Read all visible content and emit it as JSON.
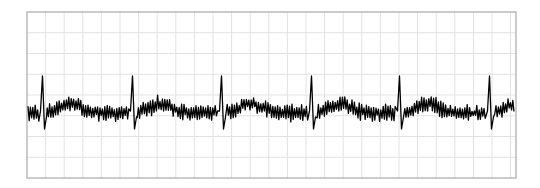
{
  "chart_data": {
    "type": "line",
    "title": "",
    "xlabel": "",
    "ylabel": "",
    "grid": true,
    "legend": null,
    "plot_area": {
      "left": 27,
      "top": 12,
      "right": 516,
      "bottom": 178
    },
    "grid_spacing": {
      "x": 18.6,
      "y": 20.75
    },
    "colors": {
      "frame": "#a8a8a8",
      "grid": "#e2e2e2",
      "trace": "#000000",
      "background": "#ffffff"
    },
    "beats": {
      "count": 6,
      "spike_x": [
        43,
        133,
        222,
        312,
        400,
        490
      ],
      "spike_peak_y": 76,
      "post_spike_dip_y": 129
    },
    "baseline": {
      "center_y": 113,
      "noise_amplitude": 10,
      "t_wave_offset_px": 28,
      "t_wave_width_px": 22,
      "t_wave_rise_px": 9
    },
    "x_range": [
      28,
      515
    ]
  }
}
